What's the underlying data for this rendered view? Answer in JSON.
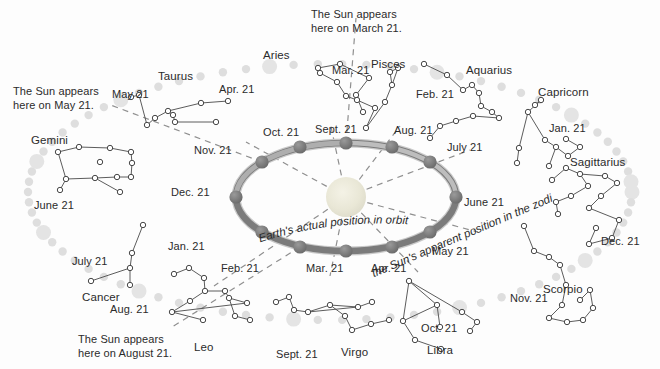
{
  "diagram": {
    "sun_name": "sun",
    "colors": {
      "orbit_ring": "#7d7d7d",
      "orbit_ring_highlight": "#b5b5b5",
      "earth_marker": "#6f6f6f",
      "sun_fill": "#e8e6d8",
      "zodiac_dot": "#dedede",
      "zodiac_dot_large": "#e4e4e4",
      "star_stroke": "#4a4a4a",
      "text": "#2b2b2b",
      "dashed_line": "#8a8a8a"
    }
  },
  "callouts": [
    {
      "id": "callout-march",
      "text": "The Sun appears\nhere on March 21.",
      "x": 311,
      "y": 8
    },
    {
      "id": "callout-may",
      "text": "The Sun appears\nhere on May 21.",
      "x": 13,
      "y": 85
    },
    {
      "id": "callout-august",
      "text": "The Sun appears\nhere on August 21.",
      "x": 78,
      "y": 333
    }
  ],
  "curve_labels": [
    {
      "id": "earth-actual-position",
      "text": "Earth's actual position in orbit",
      "x": 262,
      "y": 222
    },
    {
      "id": "sun-apparent-position",
      "text": "the Sun's apparent position in the zodiac",
      "x": 376,
      "y": 268
    }
  ],
  "constellations": [
    {
      "name": "Aries",
      "label_x": 263,
      "label_y": 48
    },
    {
      "name": "Taurus",
      "label_x": 158,
      "label_y": 69
    },
    {
      "name": "Gemini",
      "label_x": 31,
      "label_y": 133
    },
    {
      "name": "Cancer",
      "label_x": 82,
      "label_y": 290
    },
    {
      "name": "Leo",
      "label_x": 194,
      "label_y": 340
    },
    {
      "name": "Virgo",
      "label_x": 341,
      "label_y": 345
    },
    {
      "name": "Libra",
      "label_x": 427,
      "label_y": 343
    },
    {
      "name": "Scorpio",
      "label_x": 543,
      "label_y": 282
    },
    {
      "name": "Sagittarius",
      "label_x": 570,
      "label_y": 155
    },
    {
      "name": "Capricorn",
      "label_x": 538,
      "label_y": 85
    },
    {
      "name": "Aquarius",
      "label_x": 466,
      "label_y": 63
    },
    {
      "name": "Pisces",
      "label_x": 371,
      "label_y": 57
    }
  ],
  "zodiac_dates": [
    {
      "date": "Apr. 21",
      "x": 219,
      "y": 83
    },
    {
      "date": "Mar. 21",
      "x": 332,
      "y": 64
    },
    {
      "date": "Feb. 21",
      "x": 416,
      "y": 88
    },
    {
      "date": "Jan. 21",
      "x": 549,
      "y": 122
    },
    {
      "date": "Dec. 21",
      "x": 601,
      "y": 235
    },
    {
      "date": "Nov. 21",
      "x": 510,
      "y": 292
    },
    {
      "date": "Oct. 21",
      "x": 421,
      "y": 322
    },
    {
      "date": "Sept. 21",
      "x": 276,
      "y": 348
    },
    {
      "date": "Aug. 21",
      "x": 110,
      "y": 303
    },
    {
      "date": "July 21",
      "x": 72,
      "y": 255
    },
    {
      "date": "June 21",
      "x": 34,
      "y": 199
    },
    {
      "date": "May 21",
      "x": 112,
      "y": 88
    }
  ],
  "orbit_dates": [
    {
      "date": "Sept. 21",
      "x": 315,
      "y": 123,
      "px": 346,
      "py": 143
    },
    {
      "date": "Aug. 21",
      "x": 394,
      "y": 124,
      "px": 392,
      "py": 147
    },
    {
      "date": "July 21",
      "x": 447,
      "y": 141,
      "px": 430,
      "py": 162
    },
    {
      "date": "June 21",
      "x": 464,
      "y": 196,
      "px": 456,
      "py": 197
    },
    {
      "date": "May 21",
      "x": 432,
      "y": 245,
      "px": 430,
      "py": 232
    },
    {
      "date": "Apr. 21",
      "x": 371,
      "y": 262,
      "px": 392,
      "py": 247
    },
    {
      "date": "Mar. 21",
      "x": 306,
      "y": 262,
      "px": 346,
      "py": 251
    },
    {
      "date": "Feb. 21",
      "x": 221,
      "y": 262,
      "px": 300,
      "py": 247
    },
    {
      "date": "Jan. 21",
      "x": 168,
      "y": 240,
      "px": 262,
      "py": 232
    },
    {
      "date": "Dec. 21",
      "x": 171,
      "y": 186,
      "px": 236,
      "py": 197
    },
    {
      "date": "Nov. 21",
      "x": 194,
      "y": 144,
      "px": 262,
      "py": 162
    },
    {
      "date": "Oct. 21",
      "x": 263,
      "y": 126,
      "px": 300,
      "py": 147
    }
  ],
  "orbit": {
    "cx": 346,
    "cy": 197,
    "rx": 110,
    "ry": 54
  },
  "zodiac_band": {
    "cx": 330,
    "cy": 192,
    "rx": 302,
    "ry": 128
  },
  "sun": {
    "cx": 346,
    "cy": 197,
    "r": 20
  },
  "sight_lines": [
    {
      "id": "line-march",
      "from_date": "Sept. 21",
      "to_label": "Pisces"
    },
    {
      "id": "line-may",
      "from_date": "Nov. 21",
      "to_label": "Taurus"
    },
    {
      "id": "line-august",
      "from_date": "Feb. 21",
      "to_label": "Leo"
    }
  ]
}
